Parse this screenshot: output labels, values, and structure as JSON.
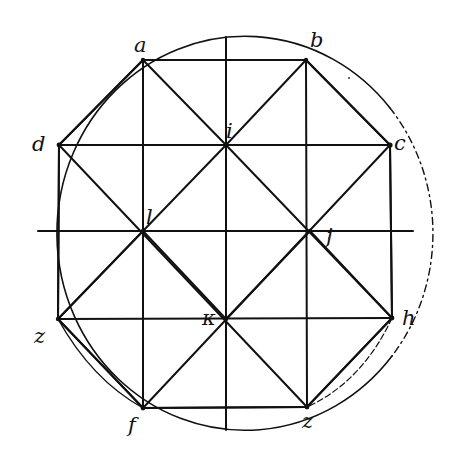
{
  "figure": {
    "type": "geometric-construction",
    "stroke_color": "#111111",
    "background": "#ffffff",
    "circle": {
      "cx": 226,
      "cy": 233,
      "rx": 188,
      "ry": 197
    },
    "labels": {
      "a": "a",
      "b": "b",
      "c": "c",
      "d": "d",
      "e": "z",
      "f": "f",
      "g": "z",
      "h": "h",
      "i": "i",
      "j": "j",
      "k": "κ",
      "l": "l"
    },
    "points": {
      "a": [
        143,
        60
      ],
      "b": [
        306,
        60
      ],
      "c": [
        390,
        145
      ],
      "d": [
        59,
        145
      ],
      "e": [
        307,
        407
      ],
      "f": [
        143,
        408
      ],
      "g": [
        58,
        319
      ],
      "h": [
        392,
        318
      ],
      "i": [
        226,
        145
      ],
      "j": [
        310,
        231
      ],
      "k": [
        226,
        319
      ],
      "l": [
        143,
        231
      ]
    }
  }
}
